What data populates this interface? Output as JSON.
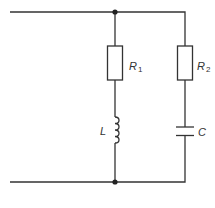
{
  "diagram": {
    "type": "circuit",
    "branches": [
      {
        "name": "branch-1",
        "components": [
          {
            "kind": "resistor",
            "symbol": "R",
            "subscript": "1"
          },
          {
            "kind": "inductor",
            "symbol": "L"
          }
        ]
      },
      {
        "name": "branch-2",
        "components": [
          {
            "kind": "resistor",
            "symbol": "R",
            "subscript": "2"
          },
          {
            "kind": "capacitor",
            "symbol": "C"
          }
        ]
      }
    ],
    "labels": {
      "r1": {
        "main": "R",
        "sub": "1"
      },
      "r2": {
        "main": "R",
        "sub": "2"
      },
      "l": "L",
      "c": "C"
    },
    "colors": {
      "line": "#333333",
      "background": "#ffffff"
    }
  }
}
